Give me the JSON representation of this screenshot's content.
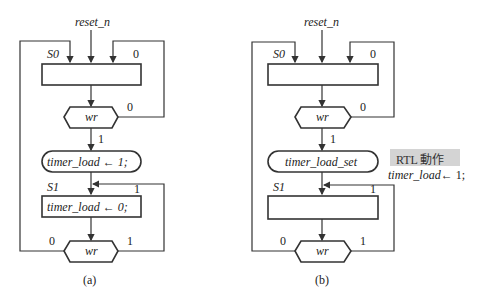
{
  "diagram_a": {
    "caption": "(a)",
    "reset_signal": "reset_n",
    "state_s0_label": "S0",
    "state_s1_label": "S1",
    "decision_top": {
      "label": "wr",
      "branch_false": "0",
      "branch_true": "1"
    },
    "loop_s0_label": "0",
    "conditional_output": "timer_load ← 1;",
    "s1_action": "timer_load ← 0;",
    "loop_s1_label": "1",
    "decision_bottom": {
      "label": "wr",
      "branch_false": "0",
      "branch_true": "1"
    }
  },
  "diagram_b": {
    "caption": "(b)",
    "reset_signal": "reset_n",
    "state_s0_label": "S0",
    "state_s1_label": "S1",
    "decision_top": {
      "label": "wr",
      "branch_false": "0",
      "branch_true": "1"
    },
    "loop_s0_label": "0",
    "conditional_output": "timer_load_set",
    "loop_s1_label": "1",
    "decision_bottom": {
      "label": "wr",
      "branch_false": "0",
      "branch_true": "1"
    }
  },
  "rtl_note": {
    "title": "RTL 動作",
    "signal": "timer_load",
    "assignment": "← 1;"
  }
}
